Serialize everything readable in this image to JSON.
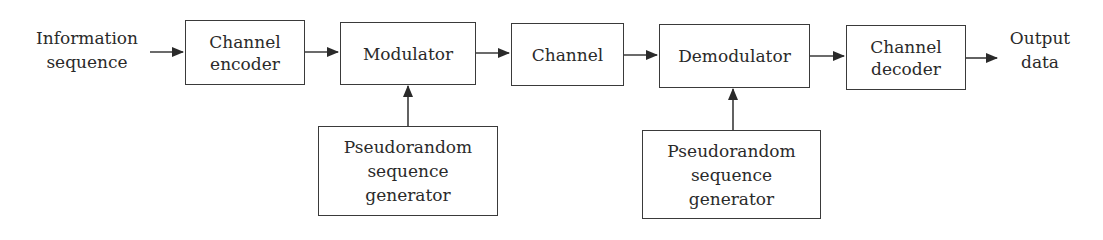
{
  "diagram": {
    "type": "block-diagram",
    "title": "",
    "input_label": [
      "Information",
      "sequence"
    ],
    "output_label": [
      "Output",
      "data"
    ],
    "blocks": [
      {
        "id": "channel-encoder",
        "lines": [
          "Channel",
          "encoder"
        ]
      },
      {
        "id": "modulator",
        "lines": [
          "Modulator"
        ]
      },
      {
        "id": "channel",
        "lines": [
          "Channel"
        ]
      },
      {
        "id": "demodulator",
        "lines": [
          "Demodulator"
        ]
      },
      {
        "id": "channel-decoder",
        "lines": [
          "Channel",
          "decoder"
        ]
      },
      {
        "id": "prsg-tx",
        "lines": [
          "Pseudorandom",
          "sequence",
          "generator"
        ]
      },
      {
        "id": "prsg-rx",
        "lines": [
          "Pseudorandom",
          "sequence",
          "generator"
        ]
      }
    ],
    "edges": [
      {
        "from": "input",
        "to": "channel-encoder"
      },
      {
        "from": "channel-encoder",
        "to": "modulator"
      },
      {
        "from": "modulator",
        "to": "channel"
      },
      {
        "from": "channel",
        "to": "demodulator"
      },
      {
        "from": "demodulator",
        "to": "channel-decoder"
      },
      {
        "from": "channel-decoder",
        "to": "output"
      },
      {
        "from": "prsg-tx",
        "to": "modulator"
      },
      {
        "from": "prsg-rx",
        "to": "demodulator"
      }
    ],
    "colors": {
      "line": "#3a3a3a",
      "text": "#2a2a2a",
      "background": "#ffffff"
    }
  }
}
